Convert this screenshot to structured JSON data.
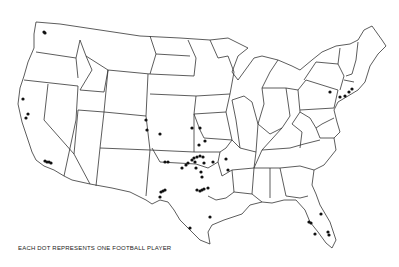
{
  "map": {
    "title": "",
    "region": "Contiguous United States",
    "legend": "EACH DOT REPRESENTS ONE FOOTBALL PLAYER",
    "colors": {
      "outline": "#333333",
      "dot": "#111111",
      "background": "#ffffff"
    },
    "dots": [
      {
        "x": 44,
        "y": 32
      },
      {
        "x": 45,
        "y": 33
      },
      {
        "x": 23,
        "y": 99
      },
      {
        "x": 28,
        "y": 114
      },
      {
        "x": 26,
        "y": 118
      },
      {
        "x": 45,
        "y": 161
      },
      {
        "x": 47,
        "y": 162
      },
      {
        "x": 49,
        "y": 162
      },
      {
        "x": 51,
        "y": 163
      },
      {
        "x": 146,
        "y": 120
      },
      {
        "x": 147,
        "y": 130
      },
      {
        "x": 160,
        "y": 134
      },
      {
        "x": 192,
        "y": 128
      },
      {
        "x": 200,
        "y": 128
      },
      {
        "x": 199,
        "y": 145
      },
      {
        "x": 205,
        "y": 141
      },
      {
        "x": 165,
        "y": 162
      },
      {
        "x": 168,
        "y": 162
      },
      {
        "x": 182,
        "y": 168
      },
      {
        "x": 186,
        "y": 165
      },
      {
        "x": 188,
        "y": 163
      },
      {
        "x": 192,
        "y": 160
      },
      {
        "x": 194,
        "y": 158
      },
      {
        "x": 195,
        "y": 162
      },
      {
        "x": 197,
        "y": 157
      },
      {
        "x": 200,
        "y": 156
      },
      {
        "x": 203,
        "y": 157
      },
      {
        "x": 204,
        "y": 163
      },
      {
        "x": 196,
        "y": 168
      },
      {
        "x": 201,
        "y": 172
      },
      {
        "x": 213,
        "y": 162
      },
      {
        "x": 226,
        "y": 159
      },
      {
        "x": 202,
        "y": 177
      },
      {
        "x": 228,
        "y": 170
      },
      {
        "x": 161,
        "y": 192
      },
      {
        "x": 163,
        "y": 191
      },
      {
        "x": 165,
        "y": 190
      },
      {
        "x": 160,
        "y": 197
      },
      {
        "x": 197,
        "y": 190
      },
      {
        "x": 200,
        "y": 191
      },
      {
        "x": 202,
        "y": 190
      },
      {
        "x": 204,
        "y": 189
      },
      {
        "x": 208,
        "y": 188
      },
      {
        "x": 210,
        "y": 217
      },
      {
        "x": 190,
        "y": 228
      },
      {
        "x": 330,
        "y": 92
      },
      {
        "x": 340,
        "y": 97
      },
      {
        "x": 345,
        "y": 96
      },
      {
        "x": 349,
        "y": 92
      },
      {
        "x": 352,
        "y": 89
      },
      {
        "x": 321,
        "y": 214
      },
      {
        "x": 309,
        "y": 222
      },
      {
        "x": 311,
        "y": 223
      },
      {
        "x": 315,
        "y": 234
      },
      {
        "x": 328,
        "y": 232
      },
      {
        "x": 329,
        "y": 235
      }
    ]
  }
}
